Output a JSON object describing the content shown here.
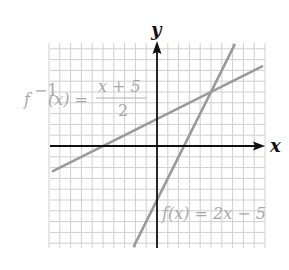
{
  "chart_data": {
    "type": "line",
    "title": "",
    "xlabel": "x",
    "ylabel": "y",
    "xlim": [
      -10,
      10
    ],
    "ylim": [
      -9.5,
      9.5
    ],
    "grid": true,
    "grid_step": 1,
    "series": [
      {
        "name": "f(x) = 2x − 5",
        "slope": 2,
        "intercept": -5,
        "color": "#9a9a9a"
      },
      {
        "name": "f⁻¹(x) = (x + 5)/2",
        "slope": 0.5,
        "intercept": 2.5,
        "color": "#9a9a9a"
      }
    ],
    "intersection": [
      5,
      5
    ],
    "annotations": [
      {
        "text": "f⁻¹(x) = (x + 5)/2",
        "position": "upper-left"
      },
      {
        "text": "f(x) = 2x − 5",
        "position": "lower-right"
      }
    ]
  },
  "labels": {
    "x_axis": "x",
    "y_axis": "y",
    "inverse_prefix": "f",
    "inverse_sup": "−1",
    "inverse_arg": "(x) =",
    "inverse_num": "x + 5",
    "inverse_den": "2",
    "f_label": "f(x) = 2x − 5"
  },
  "colors": {
    "grid": "#cfcfcf",
    "axis": "#111111",
    "line": "#9a9a9a",
    "text": "#a8a8a8"
  }
}
